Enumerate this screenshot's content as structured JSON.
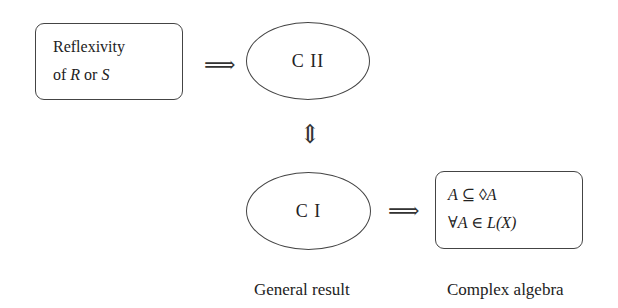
{
  "box_premise": {
    "line1": "Reflexivity",
    "line2_prefix": "of ",
    "line2_var1": "R",
    "line2_mid": " or ",
    "line2_var2": "S"
  },
  "node_c2": {
    "label": "C II"
  },
  "node_c1": {
    "label": "C I"
  },
  "box_result": {
    "line1": "A ⊆ ◊A",
    "line2": "∀A ∈ L(X)"
  },
  "arrows": {
    "implies": "⟹",
    "equiv": "⇕"
  },
  "captions": {
    "left": "General result",
    "right": "Complex algebra"
  }
}
